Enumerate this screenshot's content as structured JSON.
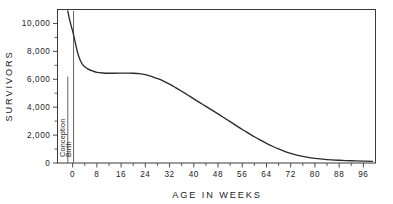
{
  "chart_data": {
    "type": "line",
    "title": "",
    "subtitle": "",
    "xlabel": "AGE IN WEEKS",
    "ylabel": "SURVIVORS",
    "xlim": [
      -5,
      100
    ],
    "ylim": [
      0,
      11000
    ],
    "grid": false,
    "legend_position": "none",
    "x_ticks": [
      0,
      8,
      16,
      24,
      32,
      40,
      48,
      56,
      64,
      72,
      80,
      88,
      96
    ],
    "x_tick_labels": [
      "0",
      "8",
      "16",
      "24",
      "32",
      "40",
      "48",
      "56",
      "64",
      "72",
      "80",
      "88",
      "96"
    ],
    "x_minor_tick_interval": 4,
    "y_ticks": [
      0,
      2000,
      4000,
      6000,
      8000,
      10000
    ],
    "y_tick_labels": [
      "0",
      "2,000",
      "4,000",
      "6,000",
      "8,000",
      "10,000"
    ],
    "y_minor_tick_interval": 1000,
    "annotations": [
      {
        "label": "Conception",
        "x": -1.6,
        "orientation": "vertical",
        "y_from": 0,
        "y_to": 6200
      },
      {
        "label": "Birth",
        "x": 0.3,
        "orientation": "vertical",
        "y_from": 0,
        "y_to": 10900
      }
    ],
    "series": [
      {
        "name": "Survivors",
        "x": [
          -1.6,
          -1.2,
          -0.8,
          -0.4,
          0,
          0.6,
          1.2,
          2,
          3,
          4,
          5,
          6.5,
          8,
          10,
          12,
          14,
          16,
          18,
          20,
          22,
          24,
          26,
          28,
          30,
          32,
          34,
          36,
          38,
          40,
          42,
          44,
          46,
          48,
          50,
          52,
          54,
          56,
          58,
          60,
          62,
          64,
          66,
          68,
          70,
          72,
          74,
          76,
          80,
          84,
          88,
          92,
          96,
          99
        ],
        "values": [
          10900,
          10450,
          10100,
          9750,
          9450,
          8900,
          8300,
          7650,
          7150,
          6900,
          6750,
          6600,
          6500,
          6450,
          6430,
          6430,
          6440,
          6440,
          6430,
          6400,
          6330,
          6210,
          6050,
          5870,
          5650,
          5400,
          5140,
          4870,
          4600,
          4330,
          4060,
          3790,
          3520,
          3240,
          2960,
          2680,
          2400,
          2140,
          1880,
          1640,
          1410,
          1200,
          1010,
          840,
          690,
          570,
          470,
          330,
          245,
          195,
          160,
          135,
          120
        ]
      }
    ]
  },
  "axis_labels": {
    "x_title": "AGE IN WEEKS",
    "y_title": "SURVIVORS"
  }
}
